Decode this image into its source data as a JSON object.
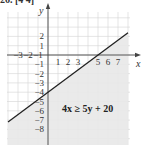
{
  "header": {
    "text": "26. [4 4]"
  },
  "chart_data": {
    "type": "inequality-graph",
    "title": "",
    "xlabel": "x",
    "ylabel": "y",
    "xlim": [
      -4,
      8
    ],
    "ylim": [
      -9,
      3.5
    ],
    "grid": true,
    "x_ticks": [
      -3,
      -2,
      -1,
      1,
      2,
      3,
      5,
      6,
      7
    ],
    "y_ticks": [
      2,
      1,
      -1,
      -2,
      -3,
      -4,
      -5,
      -6,
      -7,
      -8
    ],
    "boundary_line": {
      "equation": "y = 0.8x - 4",
      "slope": 0.8,
      "intercept": -4,
      "x_intercept": 5,
      "y_intercept": -4,
      "style": "solid"
    },
    "shaded_region": "below-right of line",
    "annotation": "4x ≥ 5y + 20",
    "colors": {
      "shade": "#e8e8e8",
      "grid": "#d4d4d4",
      "line": "#222222",
      "axis": "#444444",
      "background": "#ffffff"
    }
  }
}
